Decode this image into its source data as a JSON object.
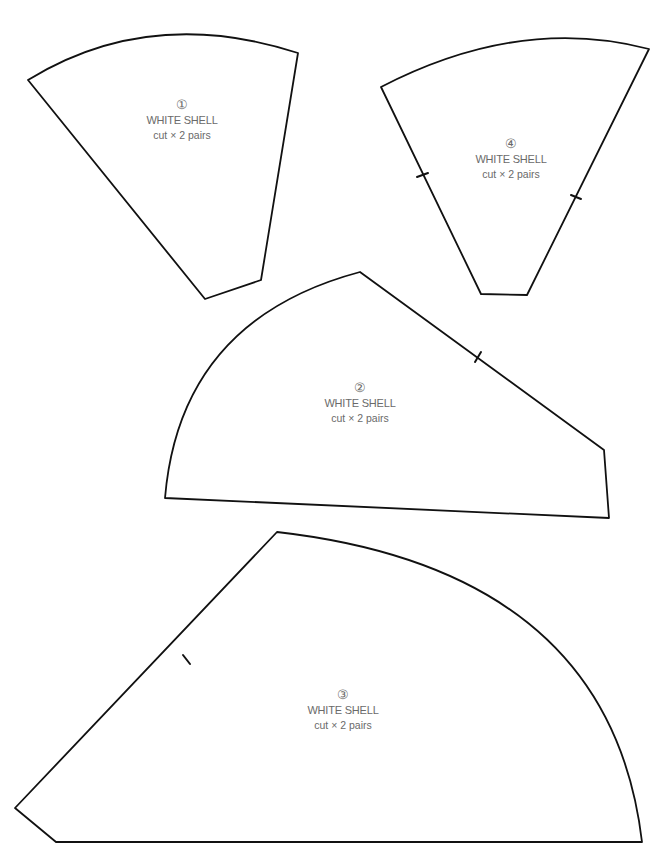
{
  "pieces": [
    {
      "id": "1",
      "number_glyph": "①",
      "name": "WHITE SHELL",
      "instruction": "cut × 2 pairs",
      "label_pos": {
        "x": 182,
        "y": 97
      }
    },
    {
      "id": "4",
      "number_glyph": "④",
      "name": "WHITE SHELL",
      "instruction": "cut × 2 pairs",
      "label_pos": {
        "x": 511,
        "y": 136
      }
    },
    {
      "id": "2",
      "number_glyph": "②",
      "name": "WHITE SHELL",
      "instruction": "cut × 2 pairs",
      "label_pos": {
        "x": 360,
        "y": 380
      }
    },
    {
      "id": "3",
      "number_glyph": "③",
      "name": "WHITE SHELL",
      "instruction": "cut × 2 pairs",
      "label_pos": {
        "x": 343,
        "y": 687
      }
    }
  ],
  "colors": {
    "outline": "#111111",
    "label_text": "#6a6a6a",
    "background": "#ffffff"
  }
}
